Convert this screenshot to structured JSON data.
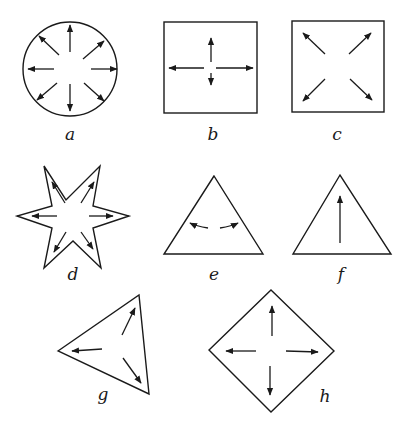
{
  "figures": [
    {
      "id": "a",
      "label": "a",
      "shape": "circle",
      "arrows": "8 radial arrows outward"
    },
    {
      "id": "b",
      "label": "b",
      "shape": "square",
      "arrows": "4 arrows: up, left, right, short down"
    },
    {
      "id": "c",
      "label": "c",
      "shape": "square",
      "arrows": "4 diagonal arrows toward corners"
    },
    {
      "id": "d",
      "label": "d",
      "shape": "six-pointed star",
      "arrows": "6 arrows toward points"
    },
    {
      "id": "e",
      "label": "e",
      "shape": "equilateral triangle",
      "arrows": "2 curved arrows left and right"
    },
    {
      "id": "f",
      "label": "f",
      "shape": "equilateral triangle",
      "arrows": "1 arrow up toward apex"
    },
    {
      "id": "g",
      "label": "g",
      "shape": "triangle (rotated)",
      "arrows": "3 arrows toward vertices"
    },
    {
      "id": "h",
      "label": "h",
      "shape": "diamond (square rotated 45°)",
      "arrows": "4 arrows toward vertices"
    }
  ],
  "colors": {
    "ink": "#1a1a1a",
    "background": "#ffffff"
  }
}
